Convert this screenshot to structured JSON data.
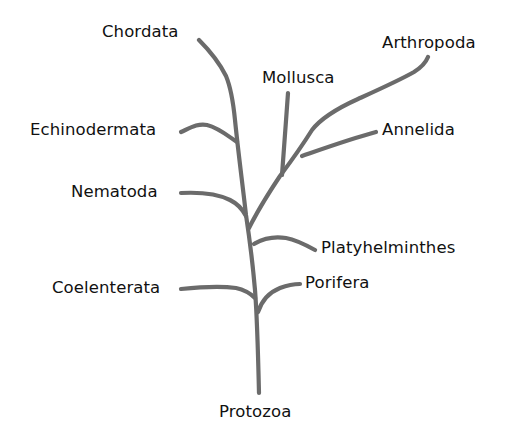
{
  "diagram": {
    "type": "phylogenetic-tree",
    "stroke_color": "#6b6b6b",
    "text_color": "#111111",
    "background": "#ffffff",
    "root": "Protozoa",
    "taxa": [
      {
        "id": "chordata",
        "label": "Chordata"
      },
      {
        "id": "arthropoda",
        "label": "Arthropoda"
      },
      {
        "id": "mollusca",
        "label": "Mollusca"
      },
      {
        "id": "echinodermata",
        "label": "Echinodermata"
      },
      {
        "id": "annelida",
        "label": "Annelida"
      },
      {
        "id": "nematoda",
        "label": "Nematoda"
      },
      {
        "id": "platyhelminthes",
        "label": "Platyhelminthes"
      },
      {
        "id": "coelenterata",
        "label": "Coelenterata"
      },
      {
        "id": "porifera",
        "label": "Porifera"
      },
      {
        "id": "protozoa",
        "label": "Protozoa"
      }
    ],
    "branches_from_root_upward": [
      {
        "from": "Protozoa",
        "branch": "Porifera",
        "side": "right"
      },
      {
        "from": "Protozoa",
        "branch": "Coelenterata",
        "side": "left"
      },
      {
        "from": "Protozoa",
        "branch": "Platyhelminthes",
        "side": "right"
      },
      {
        "from": "Protozoa",
        "branch": "Nematoda",
        "side": "left"
      },
      {
        "split": "left lineage",
        "branches": [
          "Echinodermata",
          "Chordata"
        ]
      },
      {
        "split": "right lineage",
        "branches": [
          "Mollusca",
          "Annelida",
          "Arthropoda"
        ]
      }
    ]
  }
}
